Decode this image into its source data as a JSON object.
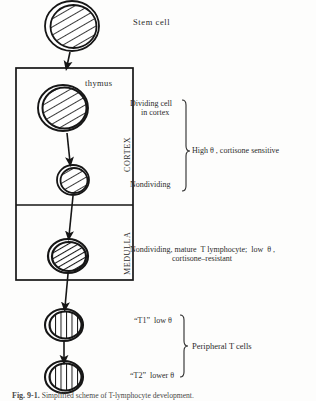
{
  "figure": {
    "caption_label": "Fig. 9-1.",
    "caption_text": "Simplified scheme of T-lymphocyte development."
  },
  "labels": {
    "stem_cell": "Stem cell",
    "thymus": "thymus",
    "cortex": "CORTEX",
    "medulla": "MEDULLA",
    "dividing_cell_line1": "Dividing cell",
    "dividing_cell_line2": "in cortex",
    "nondividing": "Nondividing",
    "high_theta": "High θ , cortisone sensitive",
    "medulla_desc_line1": "Nondividing, mature  T lymphocyte;  low  θ ,",
    "medulla_desc_line2": "cortisone–resistant",
    "t1": "“T1”  low θ",
    "t2": "“T2”  lower θ",
    "peripheral": "Peripheral T cells"
  },
  "cells": [
    {
      "name": "stem-cell",
      "hatch": "diagonal",
      "cx": 72,
      "cy": 26,
      "rx": 27,
      "ry": 25
    },
    {
      "name": "cortex-dividing-cell",
      "hatch": "diagonal",
      "cx": 63,
      "cy": 108,
      "rx": 25,
      "ry": 23
    },
    {
      "name": "cortex-nondividing-cell",
      "hatch": "diagonal",
      "cx": 73,
      "cy": 180,
      "rx": 16,
      "ry": 15
    },
    {
      "name": "medulla-cell",
      "hatch": "diagonal-dense",
      "cx": 68,
      "cy": 256,
      "rx": 20,
      "ry": 17
    },
    {
      "name": "t1-cell",
      "hatch": "vertical",
      "cx": 64,
      "cy": 325,
      "rx": 19,
      "ry": 16
    },
    {
      "name": "t2-cell",
      "hatch": "vertical",
      "cx": 64,
      "cy": 377,
      "rx": 19,
      "ry": 16
    }
  ],
  "colors": {
    "ink": "#161616",
    "text": "#2b2b2b",
    "caption": "#4a4a48",
    "background": "#fdfdfc"
  }
}
